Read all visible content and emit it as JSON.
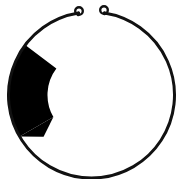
{
  "figure": {
    "type": "line-art-diagram",
    "width": 183,
    "height": 179,
    "background_color": "#ffffff",
    "stroke_color": "#111111",
    "fill_color": "#000000",
    "ring": {
      "name": "open-ring-outline",
      "center_x": 91.5,
      "center_y": 95.0,
      "radius": 83.0,
      "stroke_width": 3.0,
      "gap_top_degrees": 18,
      "gap_start_angle_deg": -99,
      "gap_end_angle_deg": -81,
      "description": "Thin black circular outline, nearly closed, with a small opening at the top"
    },
    "eyelets": [
      {
        "name": "left-eyelet",
        "label": "left loop terminal",
        "center_x": 79.0,
        "center_y": 11.0,
        "outer_radius": 5.0,
        "inner_radius": 2.6,
        "stroke_width": 2.4
      },
      {
        "name": "right-eyelet",
        "label": "right loop terminal",
        "center_x": 104.0,
        "center_y": 10.0,
        "outer_radius": 5.0,
        "inner_radius": 2.6,
        "stroke_width": 2.4
      }
    ],
    "filled_arc": {
      "name": "black-crescent-segment",
      "label": "solid black arc band on left side",
      "fill": "#000000",
      "outer_radius": 83.0,
      "inner_radius": 44.0,
      "start_angle_deg": 150,
      "end_angle_deg": 217,
      "span_degrees": 67,
      "max_thickness_px": 40,
      "leftmost_x": 8,
      "rightmost_x": 48,
      "top_y": 30,
      "bottom_y": 144
    }
  }
}
